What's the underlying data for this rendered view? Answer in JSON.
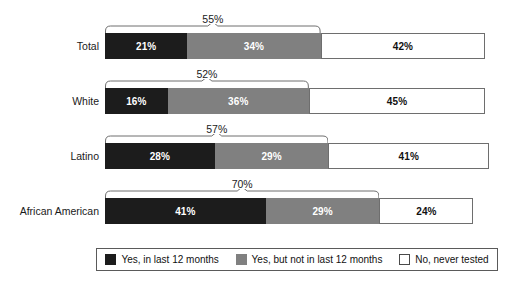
{
  "chart_data": {
    "type": "bar",
    "subtype": "stacked-horizontal-100",
    "title": "",
    "subtitle": "",
    "xlabel": "",
    "ylabel": "",
    "xlim": [
      0,
      100
    ],
    "grid": false,
    "legend_position": "bottom",
    "categories": [
      "Total",
      "White",
      "Latino",
      "African American"
    ],
    "series": [
      {
        "name": "Yes, in last 12 months",
        "key": "yes_recent",
        "color": "#1c1c1c",
        "values": [
          21,
          16,
          28,
          41
        ]
      },
      {
        "name": "Yes, but not in last 12 months",
        "key": "yes_older",
        "color": "#808080",
        "values": [
          34,
          36,
          29,
          29
        ]
      },
      {
        "name": "No, never tested",
        "key": "never",
        "color": "#ffffff",
        "values": [
          42,
          45,
          41,
          24
        ]
      }
    ],
    "annotations": [
      {
        "category": "Total",
        "label": "55%",
        "spans": [
          "Yes, in last 12 months",
          "Yes, but not in last 12 months"
        ],
        "value": 55
      },
      {
        "category": "White",
        "label": "52%",
        "spans": [
          "Yes, in last 12 months",
          "Yes, but not in last 12 months"
        ],
        "value": 52
      },
      {
        "category": "Latino",
        "label": "57%",
        "spans": [
          "Yes, in last 12 months",
          "Yes, but not in last 12 months"
        ],
        "value": 57
      },
      {
        "category": "African American",
        "label": "70%",
        "spans": [
          "Yes, in last 12 months",
          "Yes, but not in last 12 months"
        ],
        "value": 70
      }
    ]
  },
  "rows": [
    {
      "label": "Total",
      "bracket_label": "55%",
      "bracket_value": 55,
      "segments": [
        {
          "name": "yes_recent",
          "label": "21%",
          "value": 21
        },
        {
          "name": "yes_older",
          "label": "34%",
          "value": 34
        },
        {
          "name": "never",
          "label": "42%",
          "value": 42
        }
      ]
    },
    {
      "label": "White",
      "bracket_label": "52%",
      "bracket_value": 52,
      "segments": [
        {
          "name": "yes_recent",
          "label": "16%",
          "value": 16
        },
        {
          "name": "yes_older",
          "label": "36%",
          "value": 36
        },
        {
          "name": "never",
          "label": "45%",
          "value": 45
        }
      ]
    },
    {
      "label": "Latino",
      "bracket_label": "57%",
      "bracket_value": 57,
      "segments": [
        {
          "name": "yes_recent",
          "label": "28%",
          "value": 28
        },
        {
          "name": "yes_older",
          "label": "29%",
          "value": 29
        },
        {
          "name": "never",
          "label": "41%",
          "value": 41
        }
      ]
    },
    {
      "label": "African American",
      "bracket_label": "70%",
      "bracket_value": 70,
      "segments": [
        {
          "name": "yes_recent",
          "label": "41%",
          "value": 41
        },
        {
          "name": "yes_older",
          "label": "29%",
          "value": 29
        },
        {
          "name": "never",
          "label": "24%",
          "value": 24
        }
      ]
    }
  ],
  "legend": {
    "items": [
      {
        "label": "Yes, in last 12 months",
        "swatch": "black"
      },
      {
        "label": "Yes, but not in last 12 months",
        "swatch": "gray"
      },
      {
        "label": "No, never tested",
        "swatch": "white"
      }
    ]
  },
  "layout": {
    "plot_left_px": 105,
    "plot_full_width_px": 392,
    "row_tops_px": [
      33,
      88,
      143,
      198
    ],
    "bar_height_px": 26
  },
  "colors": {
    "yes_recent": "#1c1c1c",
    "yes_older": "#808080",
    "never": "#ffffff",
    "outline": "#6e6e6e",
    "text": "#111111"
  }
}
